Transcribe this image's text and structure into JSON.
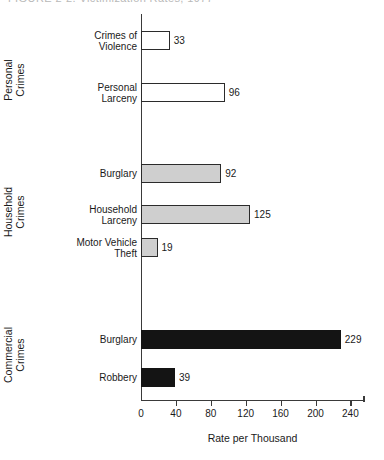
{
  "header": {
    "clipped_text": "FIGURE 2-2.  Victimization Rates, 1977"
  },
  "chart_data": {
    "type": "bar",
    "orientation": "horizontal",
    "title": "",
    "xlabel": "Rate per Thousand",
    "ylabel": "",
    "xlim": [
      0,
      255
    ],
    "xticks": [
      0,
      40,
      80,
      120,
      160,
      200,
      240
    ],
    "xticklabels": [
      "0",
      "40",
      "80",
      "120",
      "160",
      "200",
      "240"
    ],
    "grid": false,
    "legend": false,
    "groups": [
      {
        "name": "Personal\nCrimes",
        "fill": "white",
        "categories": [
          "Crimes of\nViolence",
          "Personal\nLarceny"
        ],
        "values": [
          33,
          96
        ]
      },
      {
        "name": "Household\nCrimes",
        "fill": "gray",
        "categories": [
          "Burglary",
          "Household\nLarceny",
          "Motor Vehicle\nTheft"
        ],
        "values": [
          92,
          125,
          19
        ]
      },
      {
        "name": "Commercial\nCrimes",
        "fill": "black",
        "categories": [
          "Burglary",
          "Robbery"
        ],
        "values": [
          229,
          39
        ]
      }
    ],
    "bars": [
      {
        "label": "Crimes of\nViolence",
        "value": 33,
        "value_text": "33",
        "group": "Personal Crimes",
        "fill": "white",
        "top": 17
      },
      {
        "label": "Personal\nLarceny",
        "value": 96,
        "value_text": "96",
        "group": "Personal Crimes",
        "fill": "white",
        "top": 69
      },
      {
        "label": "Burglary",
        "value": 92,
        "value_text": "92",
        "group": "Household Crimes",
        "fill": "gray",
        "top": 150
      },
      {
        "label": "Household\nLarceny",
        "value": 125,
        "value_text": "125",
        "group": "Household Crimes",
        "fill": "gray",
        "top": 191
      },
      {
        "label": "Motor Vehicle\nTheft",
        "value": 19,
        "value_text": "19",
        "group": "Household Crimes",
        "fill": "gray",
        "top": 224
      },
      {
        "label": "Burglary",
        "value": 229,
        "value_text": "229",
        "group": "Commercial Crimes",
        "fill": "black",
        "top": 316
      },
      {
        "label": "Robbery",
        "value": 39,
        "value_text": "39",
        "group": "Commercial Crimes",
        "fill": "black",
        "top": 354
      }
    ],
    "group_labels": [
      {
        "text": "Personal\nCrimes",
        "center_y": 80
      },
      {
        "text": "Household\nCrimes",
        "center_y": 212
      },
      {
        "text": "Commercial\nCrimes",
        "center_y": 355
      }
    ],
    "colors": {
      "axis": "#3a3a3a",
      "text": "#1a1a1a",
      "fill_white": "#ffffff",
      "fill_gray": "#cfcfcf",
      "fill_black": "#141414",
      "background": "#ffffff"
    }
  }
}
